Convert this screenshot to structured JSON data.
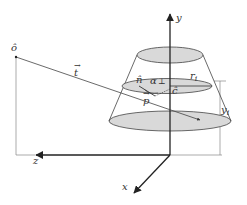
{
  "diagram": {
    "labels": {
      "origin_point": "ô",
      "ray_vector": "t",
      "normal": "n̂",
      "alpha": "α",
      "perp": "⊥",
      "center": "ĉ",
      "point": "p",
      "radius": "r",
      "radius_sub": "i",
      "height": "y",
      "height_sub": "i",
      "axis_y": "y",
      "axis_z": "z",
      "axis_x": "x"
    },
    "colors": {
      "stroke": "#333333",
      "ellipse_fill": "#d9d9d9",
      "guide_line": "#888888",
      "background": "#ffffff"
    }
  }
}
